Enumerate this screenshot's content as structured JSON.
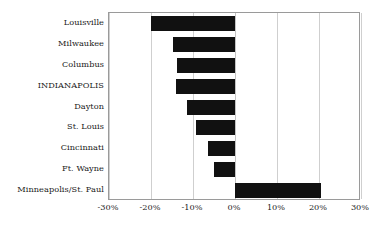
{
  "chart_data": {
    "type": "bar",
    "orientation": "horizontal",
    "title": "",
    "subtitle": "",
    "xlabel": "",
    "ylabel": "",
    "categories": [
      "Louisville",
      "Milwaukee",
      "Columbus",
      "INDIANAPOLIS",
      "Dayton",
      "St. Louis",
      "Cincinnati",
      "Ft. Wayne",
      "Minneapolis/St. Paul"
    ],
    "values": [
      -20.0,
      -14.8,
      -13.8,
      -14.0,
      -11.4,
      -9.3,
      -6.4,
      -5.0,
      20.5
    ],
    "xlim": [
      -30,
      30
    ],
    "xticks": [
      -30,
      -20,
      -10,
      0,
      10,
      20,
      30
    ],
    "xtick_labels": [
      "-30%",
      "-20%",
      "-10%",
      "0%",
      "10%",
      "20%",
      "30%"
    ],
    "grid": true,
    "grid_axis": "x",
    "legend": false,
    "legend_position": "none",
    "bar_color": "#111111",
    "grid_color": "#cfcfcf",
    "axis_border_color": "#9a9a9a",
    "background_color": "#ffffff",
    "highlight_category": "INDIANAPOLIS"
  }
}
